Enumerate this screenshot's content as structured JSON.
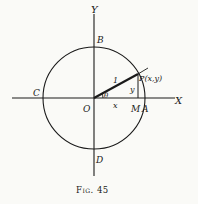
{
  "figure": {
    "caption": "Fig. 45",
    "labels": {
      "y_axis": "Y",
      "x_axis": "X",
      "b": "B",
      "c": "C",
      "d": "D",
      "o": "O",
      "a": "A",
      "m": "M",
      "p": "P(x,y)",
      "radius": "1",
      "theta": "θ",
      "x_len": "x",
      "y_len": "y"
    },
    "colors": {
      "ink": "#1a1a1a",
      "paper": "#fafaf7"
    }
  }
}
